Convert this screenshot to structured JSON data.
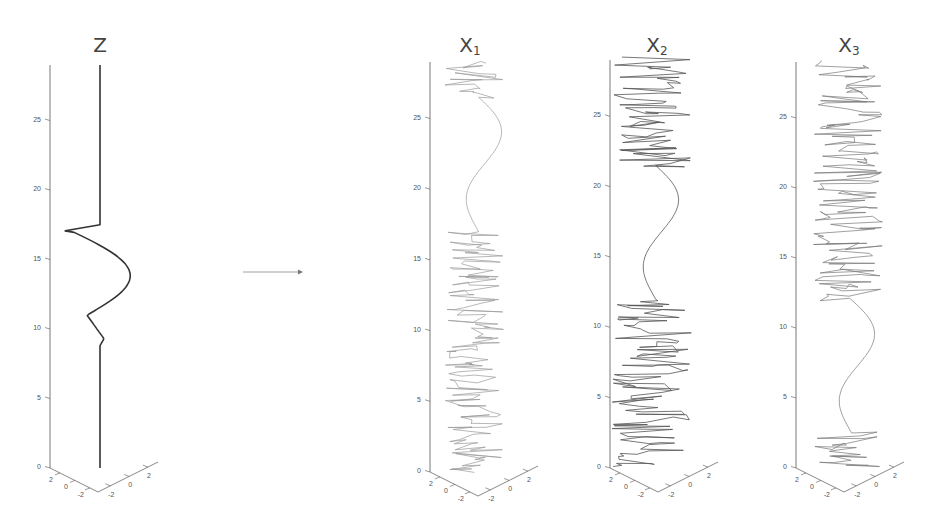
{
  "figure": {
    "arrow": {
      "from": "Z",
      "to": "X1"
    }
  },
  "chart_data": [
    {
      "type": "line",
      "title": "Z",
      "axes": "3d",
      "zlabel_ticks": [
        "0",
        "5",
        "10",
        "15",
        "20",
        "25"
      ],
      "x_ticks": [
        "2",
        "0",
        "-2"
      ],
      "y_ticks": [
        "-2",
        "0",
        "2"
      ],
      "zlim": [
        0,
        29
      ],
      "description": "Vertical line with a sinusoidal excursion between z≈9 and z≈17",
      "series": [
        {
          "name": "Z",
          "style": "dark solid",
          "features": [
            {
              "z_range": [
                0,
                8.8
              ],
              "shape": "straight"
            },
            {
              "z_range": [
                8.8,
                17.5
              ],
              "shape": "sine bump, sharp cusps at z≈11 and z≈17"
            },
            {
              "z_range": [
                17.5,
                29
              ],
              "shape": "straight"
            }
          ]
        }
      ]
    },
    {
      "type": "line",
      "title": "X1",
      "axes": "3d",
      "zlabel_ticks": [
        "0",
        "5",
        "10",
        "15",
        "20",
        "25"
      ],
      "x_ticks": [
        "2",
        "0",
        "-2"
      ],
      "y_ticks": [
        "-2",
        "0",
        "2"
      ],
      "zlim": [
        0,
        29
      ],
      "series": [
        {
          "name": "X1",
          "style": "light gray",
          "features": [
            {
              "z_range": [
                0,
                17
              ],
              "shape": "noise"
            },
            {
              "z_range": [
                17,
                26.5
              ],
              "shape": "smooth sine"
            },
            {
              "z_range": [
                26.5,
                29
              ],
              "shape": "noise"
            }
          ]
        }
      ]
    },
    {
      "type": "line",
      "title": "X2",
      "axes": "3d",
      "zlabel_ticks": [
        "0",
        "5",
        "10",
        "15",
        "20",
        "25"
      ],
      "x_ticks": [
        "2",
        "0",
        "-2"
      ],
      "y_ticks": [
        "-2",
        "0",
        "2"
      ],
      "zlim": [
        0,
        29
      ],
      "series": [
        {
          "name": "X2",
          "style": "dark gray",
          "features": [
            {
              "z_range": [
                0,
                12
              ],
              "shape": "noise"
            },
            {
              "z_range": [
                12,
                21.5
              ],
              "shape": "smooth sine"
            },
            {
              "z_range": [
                21.5,
                29
              ],
              "shape": "noise"
            }
          ]
        }
      ]
    },
    {
      "type": "line",
      "title": "X3",
      "axes": "3d",
      "zlabel_ticks": [
        "0",
        "5",
        "10",
        "15",
        "20",
        "25"
      ],
      "x_ticks": [
        "2",
        "0",
        "-2"
      ],
      "y_ticks": [
        "-2",
        "0",
        "2"
      ],
      "zlim": [
        0,
        29
      ],
      "series": [
        {
          "name": "X3",
          "style": "medium gray",
          "features": [
            {
              "z_range": [
                0,
                2.5
              ],
              "shape": "noise"
            },
            {
              "z_range": [
                2.5,
                12
              ],
              "shape": "smooth sine"
            },
            {
              "z_range": [
                12,
                29
              ],
              "shape": "noise"
            }
          ]
        }
      ]
    }
  ],
  "panels": [
    {
      "title_main": "Z",
      "title_sub": ""
    },
    {
      "title_main": "X",
      "title_sub": "1"
    },
    {
      "title_main": "X",
      "title_sub": "2"
    },
    {
      "title_main": "X",
      "title_sub": "3"
    }
  ],
  "ticks": {
    "z": [
      "0",
      "5",
      "10",
      "15",
      "20",
      "25"
    ],
    "left": [
      "2",
      "0",
      "-2"
    ],
    "right": [
      "-2",
      "0",
      "2"
    ]
  }
}
